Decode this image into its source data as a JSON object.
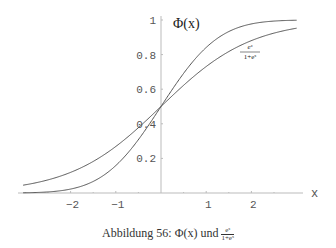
{
  "chart_data": {
    "type": "line",
    "title": "",
    "xlabel": "x",
    "ylabel": "",
    "xlim": [
      -3.2,
      3.1
    ],
    "ylim": [
      0,
      1.0
    ],
    "grid": false,
    "x_ticks": [
      "-2",
      "-1",
      "1",
      "2"
    ],
    "y_ticks": [
      "0.2",
      "0.4",
      "0.6",
      "0.8",
      "1"
    ],
    "series": [
      {
        "name": "Φ(x)",
        "function": "standard normal CDF",
        "x": [
          -3,
          -2,
          -1,
          0,
          1,
          2,
          3
        ],
        "values": [
          0.001,
          0.023,
          0.159,
          0.5,
          0.841,
          0.977,
          0.999
        ]
      },
      {
        "name": "e^x/(1+e^x)",
        "function": "logistic",
        "x": [
          -3,
          -2,
          -1,
          0,
          1,
          2,
          3
        ],
        "values": [
          0.047,
          0.119,
          0.269,
          0.5,
          0.731,
          0.881,
          0.953
        ]
      }
    ],
    "annotations": [
      "Φ(x)",
      "e^x/(1+e^x)"
    ]
  },
  "labels": {
    "phi": "Φ(x)",
    "logistic_num": "e",
    "logistic_num_sup": "x",
    "logistic_den": "1+e",
    "logistic_den_sup": "x",
    "x_axis": "x"
  },
  "caption": {
    "prefix": "Abbildung 56: Φ(x) und ",
    "frac_num": "eˣ",
    "frac_den": "1+eˣ"
  },
  "ticks": {
    "x": [
      {
        "v": -2,
        "t": "−2"
      },
      {
        "v": -1,
        "t": "−1"
      },
      {
        "v": 1,
        "t": "1"
      },
      {
        "v": 2,
        "t": "2"
      }
    ],
    "y": [
      {
        "v": 0.2,
        "t": "0.2"
      },
      {
        "v": 0.4,
        "t": "0.4"
      },
      {
        "v": 0.6,
        "t": "0.6"
      },
      {
        "v": 0.8,
        "t": "0.8"
      },
      {
        "v": 1,
        "t": "1"
      }
    ]
  },
  "colors": {
    "curve": "#555555",
    "axis": "#bbbbbb"
  }
}
